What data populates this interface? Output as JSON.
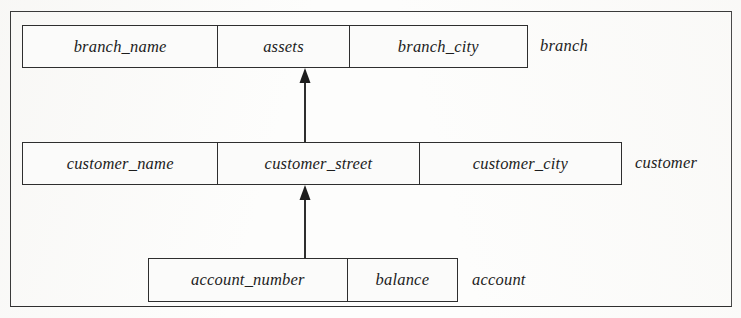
{
  "figure": {
    "kind": "database-schema-diagram",
    "background_color": "#fdfdfc",
    "line_color": "#2e2e2e",
    "text_color": "#1d1d1d"
  },
  "relations": [
    {
      "name": "branch",
      "label": "branch",
      "attributes": [
        {
          "label": "branch_name"
        },
        {
          "label": "assets"
        },
        {
          "label": "branch_city"
        }
      ]
    },
    {
      "name": "customer",
      "label": "customer",
      "attributes": [
        {
          "label": "customer_name"
        },
        {
          "label": "customer_street"
        },
        {
          "label": "customer_city"
        }
      ]
    },
    {
      "name": "account",
      "label": "account",
      "attributes": [
        {
          "label": "account_number"
        },
        {
          "label": "balance"
        }
      ]
    }
  ],
  "arrows": [
    {
      "name": "customer-to-branch",
      "direction": "up",
      "from": "customer",
      "to": "branch"
    },
    {
      "name": "account-to-customer",
      "direction": "up",
      "from": "account",
      "to": "customer"
    }
  ]
}
